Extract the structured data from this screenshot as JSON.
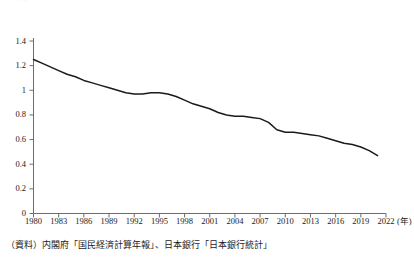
{
  "chart_data": {
    "type": "line",
    "title": "図表  日本のマネーマルチプライヤー（マネーストック／マネタリーベース）の推移",
    "subtitle": "",
    "xlabel": "(年)",
    "ylabel": "",
    "xlim": [
      1980,
      2022
    ],
    "ylim": [
      0,
      1.4
    ],
    "grid": false,
    "legend": null,
    "legend_position": "none",
    "line_color": "#1a1a1a",
    "x_tick_labels": [
      "1980",
      "1983",
      "1986",
      "1989",
      "1992",
      "1995",
      "1998",
      "2001",
      "2004",
      "2007",
      "2010",
      "2013",
      "2016",
      "2019",
      "2022"
    ],
    "x_tick_values": [
      1980,
      1983,
      1986,
      1989,
      1992,
      1995,
      1998,
      2001,
      2004,
      2007,
      2010,
      2013,
      2016,
      2019,
      2022
    ],
    "y_tick_labels": [
      "0",
      "0.2",
      "0.4",
      "0.6",
      "0.8",
      "1",
      "1.2",
      "1.4"
    ],
    "y_tick_values": [
      0,
      0.2,
      0.4,
      0.6,
      0.8,
      1.0,
      1.2,
      1.4
    ],
    "x": [
      1980,
      1981,
      1982,
      1983,
      1984,
      1985,
      1986,
      1987,
      1988,
      1989,
      1990,
      1991,
      1992,
      1993,
      1994,
      1995,
      1996,
      1997,
      1998,
      1999,
      2000,
      2001,
      2002,
      2003,
      2004,
      2005,
      2006,
      2007,
      2008,
      2009,
      2010,
      2011,
      2012,
      2013,
      2014,
      2015,
      2016,
      2017,
      2018,
      2019,
      2020,
      2021
    ],
    "values": [
      1.25,
      1.22,
      1.19,
      1.16,
      1.13,
      1.11,
      1.08,
      1.06,
      1.04,
      1.02,
      1.0,
      0.98,
      0.97,
      0.97,
      0.98,
      0.98,
      0.97,
      0.95,
      0.92,
      0.89,
      0.87,
      0.85,
      0.82,
      0.8,
      0.79,
      0.79,
      0.78,
      0.77,
      0.74,
      0.68,
      0.66,
      0.66,
      0.65,
      0.64,
      0.63,
      0.61,
      0.59,
      0.57,
      0.56,
      0.54,
      0.51,
      0.47
    ],
    "series": [
      {
        "name": "マネーマルチプライヤー",
        "values": [
          1.25,
          1.22,
          1.19,
          1.16,
          1.13,
          1.11,
          1.08,
          1.06,
          1.04,
          1.02,
          1.0,
          0.98,
          0.97,
          0.97,
          0.98,
          0.98,
          0.97,
          0.95,
          0.92,
          0.89,
          0.87,
          0.85,
          0.82,
          0.8,
          0.79,
          0.79,
          0.78,
          0.77,
          0.74,
          0.68,
          0.66,
          0.66,
          0.65,
          0.64,
          0.63,
          0.61,
          0.59,
          0.57,
          0.56,
          0.54,
          0.51,
          0.47
        ]
      }
    ]
  },
  "source": {
    "note": "（資料）内閣府「国民経済計算年報」、日本銀行「日本銀行統計」"
  }
}
